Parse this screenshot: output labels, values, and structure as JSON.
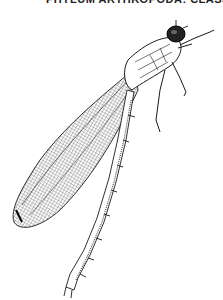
{
  "header": {
    "clipped_caption": "PHYLUM ARTHROPODA: CLASS INSECTA"
  },
  "illustration": {
    "subject": "damselfly",
    "style": "black-and-white line engraving",
    "colors": {
      "ink": "#1a1a1a",
      "background": "#ffffff"
    }
  }
}
